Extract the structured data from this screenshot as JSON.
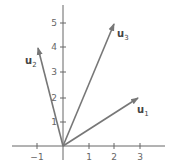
{
  "diagram": {
    "type": "vector-plot",
    "axes": {
      "x_ticks": [
        {
          "value": -1,
          "label": "−1"
        },
        {
          "value": 1,
          "label": "1"
        },
        {
          "value": 2,
          "label": "2"
        },
        {
          "value": 3,
          "label": "3"
        }
      ],
      "y_ticks": [
        {
          "value": 1,
          "label": "1"
        },
        {
          "value": 2,
          "label": "2"
        },
        {
          "value": 3,
          "label": "3"
        },
        {
          "value": 4,
          "label": "4"
        },
        {
          "value": 5,
          "label": "5"
        }
      ]
    },
    "vectors": [
      {
        "name": "u",
        "sub": "1",
        "x": 3,
        "y": 2
      },
      {
        "name": "u",
        "sub": "2",
        "x": -1,
        "y": 4
      },
      {
        "name": "u",
        "sub": "3",
        "x": 2,
        "y": 5
      }
    ],
    "colors": {
      "axis": "#666666",
      "vector": "#777777",
      "label": "#444444"
    }
  }
}
